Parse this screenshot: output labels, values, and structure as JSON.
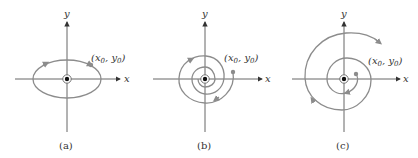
{
  "figure": {
    "panels": [
      {
        "id": "a",
        "caption": "(a)",
        "x_label": "x",
        "y_label": "y",
        "point_label_x": "x",
        "point_label_y": "y",
        "point_label_sub": "0",
        "curve": "ellipse (center)"
      },
      {
        "id": "b",
        "caption": "(b)",
        "x_label": "x",
        "y_label": "y",
        "point_label_x": "x",
        "point_label_y": "y",
        "point_label_sub": "0",
        "curve": "inward spiral (spiral sink)"
      },
      {
        "id": "c",
        "caption": "(c)",
        "x_label": "x",
        "y_label": "y",
        "point_label_x": "x",
        "point_label_y": "y",
        "point_label_sub": "0",
        "curve": "outward spiral (spiral source)"
      }
    ],
    "colors": {
      "axis": "#555555",
      "curve": "#8c8c8c",
      "text": "#333333",
      "equilibrium": "#111111"
    }
  }
}
